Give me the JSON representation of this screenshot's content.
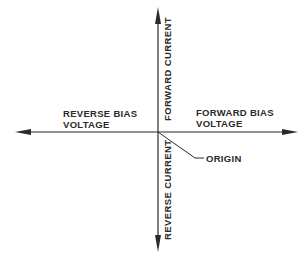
{
  "diagram": {
    "type": "quadrant-axes",
    "colors": {
      "line": "#2a2a2a",
      "text": "#2a2a2a",
      "background": "#ffffff"
    },
    "labels": {
      "reverse_bias": {
        "line1": "REVERSE BIAS",
        "line2": "VOLTAGE"
      },
      "forward_bias": {
        "line1": "FORWARD BIAS",
        "line2": "VOLTAGE"
      },
      "forward_current": "FORWARD CURRENT",
      "reverse_current": "REVERSE CURRENT",
      "origin": "ORIGIN"
    },
    "axes": {
      "horizontal": {
        "left_direction": "reverse bias voltage",
        "right_direction": "forward bias voltage"
      },
      "vertical": {
        "up_direction": "forward current",
        "down_direction": "reverse current"
      }
    }
  }
}
